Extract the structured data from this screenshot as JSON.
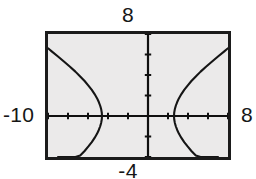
{
  "graph": {
    "window_labels": {
      "ymax": "8",
      "ymin": "-4",
      "xmin": "-10",
      "xmax": "8"
    },
    "colors": {
      "screen_background": "#ebeaea",
      "frame_border": "#1b1b1b",
      "axis": "#101010",
      "curve": "#151515",
      "page_background": "#ffffff"
    }
  },
  "chart_data": {
    "type": "line",
    "title": "",
    "xlabel": "",
    "ylabel": "",
    "xlim": [
      -10,
      8
    ],
    "ylim": [
      -4,
      8
    ],
    "grid": false,
    "legend": "none",
    "axis_tick_step_x": 2,
    "axis_tick_step_y": 2,
    "x_tick_labels": [
      "-10",
      "-8",
      "-6",
      "-4",
      "-2",
      "0",
      "2",
      "4",
      "6",
      "8"
    ],
    "y_tick_labels": [
      "-4",
      "-2",
      "0",
      "2",
      "4",
      "6",
      "8"
    ],
    "annotations": [
      "Graphing calculator viewport",
      "Hyperbola opening left and right",
      "Left branch vertex near x = -4.6",
      "Right branch vertex near x = 2.6"
    ],
    "series": [
      {
        "name": "hyperbola-left-branch",
        "comment": "upper half of left branch, traced right-to-left from vertex",
        "x": [
          -4.6,
          -4.62,
          -4.68,
          -4.78,
          -4.92,
          -5.1,
          -5.34,
          -5.62,
          -5.96,
          -6.34,
          -6.78,
          -7.26,
          -7.8,
          -8.38,
          -9.0,
          -9.66,
          -10.0
        ],
        "y": [
          0.0,
          0.32,
          0.65,
          1.0,
          1.36,
          1.74,
          2.14,
          2.55,
          2.97,
          3.41,
          3.86,
          4.33,
          4.81,
          5.3,
          5.81,
          6.33,
          6.61
        ]
      },
      {
        "name": "hyperbola-left-branch-lower",
        "comment": "lower half of left branch",
        "x": [
          -4.6,
          -4.62,
          -4.68,
          -4.78,
          -4.92,
          -5.1,
          -5.34,
          -5.62,
          -5.96,
          -6.34,
          -6.78,
          -7.26,
          -7.8,
          -8.38,
          -9.0
        ],
        "y": [
          0.0,
          -0.32,
          -0.65,
          -1.0,
          -1.36,
          -1.74,
          -2.14,
          -2.55,
          -2.97,
          -3.41,
          -3.86,
          -4.0,
          -4.0,
          -4.0,
          -4.0
        ]
      },
      {
        "name": "hyperbola-right-branch-upper",
        "comment": "upper half of right branch",
        "x": [
          2.6,
          2.62,
          2.68,
          2.78,
          2.92,
          3.1,
          3.34,
          3.62,
          3.96,
          4.34,
          4.78,
          5.26,
          5.8,
          6.38,
          7.0,
          7.66,
          8.0
        ],
        "y": [
          0.0,
          0.32,
          0.65,
          1.0,
          1.36,
          1.74,
          2.14,
          2.55,
          2.97,
          3.41,
          3.86,
          4.33,
          4.81,
          5.3,
          5.81,
          6.33,
          6.61
        ]
      },
      {
        "name": "hyperbola-right-branch-lower",
        "comment": "lower half of right branch",
        "x": [
          2.6,
          2.62,
          2.68,
          2.78,
          2.92,
          3.1,
          3.34,
          3.62,
          3.96,
          4.34,
          4.78,
          5.26,
          5.8,
          6.38,
          7.0
        ],
        "y": [
          0.0,
          -0.32,
          -0.65,
          -1.0,
          -1.36,
          -1.74,
          -2.14,
          -2.55,
          -2.97,
          -3.41,
          -3.86,
          -4.0,
          -4.0,
          -4.0,
          -4.0
        ]
      }
    ]
  }
}
